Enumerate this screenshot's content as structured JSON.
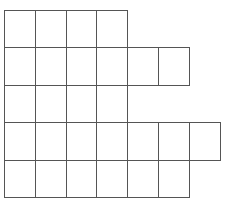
{
  "diagram": {
    "type": "square-grid-shape",
    "origin": {
      "x": 4,
      "y": 10
    },
    "cell_width": 30.8,
    "cell_height": 37.4,
    "line_color": "#555555",
    "background": "#ffffff",
    "rows": [
      {
        "row": 1,
        "cells": 4
      },
      {
        "row": 2,
        "cells": 6
      },
      {
        "row": 3,
        "cells": 4
      },
      {
        "row": 4,
        "cells": 7
      },
      {
        "row": 5,
        "cells": 6
      }
    ],
    "total_cells": 27
  }
}
